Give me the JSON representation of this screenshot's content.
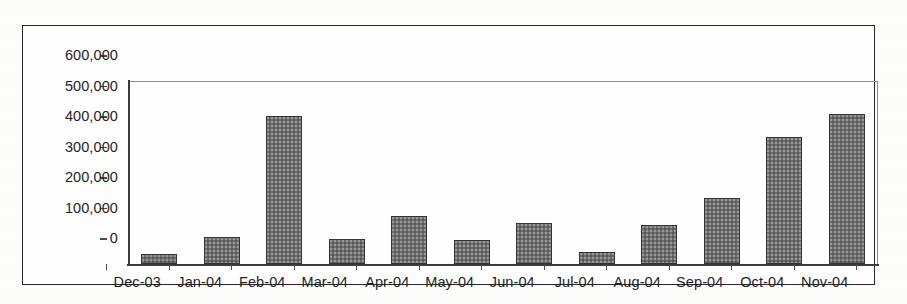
{
  "chart_data": {
    "type": "bar",
    "title": "",
    "subtitle": "",
    "xlabel": "",
    "ylabel": "",
    "categories": [
      "Dec-03",
      "Jan-04",
      "Feb-04",
      "Mar-04",
      "Apr-04",
      "May-04",
      "Jun-04",
      "Jul-04",
      "Aug-04",
      "Sep-04",
      "Oct-04",
      "Nov-04"
    ],
    "values": [
      33000,
      88000,
      485000,
      83000,
      157000,
      79000,
      134000,
      40000,
      128000,
      216000,
      417000,
      493000
    ],
    "series": [
      {
        "name": "",
        "values": [
          33000,
          88000,
          485000,
          83000,
          157000,
          79000,
          134000,
          40000,
          128000,
          216000,
          417000,
          493000
        ]
      }
    ],
    "ylim": [
      0,
      600000
    ],
    "ytick_values": [
      0,
      100000,
      200000,
      300000,
      400000,
      500000,
      600000
    ],
    "ytick_labels": [
      "0",
      "100,000",
      "200,000",
      "300,000",
      "400,000",
      "500,000",
      "600,000"
    ],
    "grid": false,
    "legend": false,
    "legend_position": "none",
    "annotations": [],
    "bar_color": "#6e6e6e",
    "bar_border_color": "#333333",
    "axis_color": "#3a3a3a",
    "plot_border_color": "#8d8d8d",
    "frame_color": "#2a2a2a",
    "background_color": "#ffffff",
    "text_color": "#1e1e1e"
  }
}
